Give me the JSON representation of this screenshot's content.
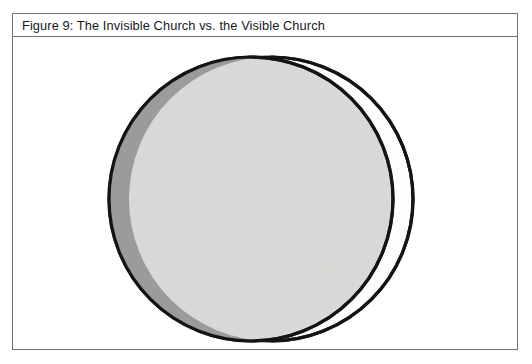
{
  "figure": {
    "caption": "Figure 9: The Invisible Church vs. the Visible Church",
    "frame": {
      "border_color": "#6f7276",
      "background_color": "#ffffff"
    }
  },
  "diagram": {
    "type": "overlapping-circles",
    "outline_color": "#141414",
    "shapes": [
      {
        "id": "visible-church-circle",
        "label": "Visible Church",
        "role": "back",
        "center_x": 270,
        "center_y": 196,
        "radius": 143,
        "fill": "#ffffff",
        "stroke": "#141414",
        "stroke_width": 3
      },
      {
        "id": "invisible-church-circle",
        "label": "Invisible Church",
        "role": "front",
        "center_x": 250,
        "center_y": 196,
        "radius": 143,
        "fill": "#d9dad7",
        "stroke": "#141414",
        "stroke_width": 3
      },
      {
        "id": "left-crescent",
        "label": "Left crescent",
        "role": "overlap-shading",
        "fill": "#9a9c99"
      }
    ],
    "legend": []
  }
}
